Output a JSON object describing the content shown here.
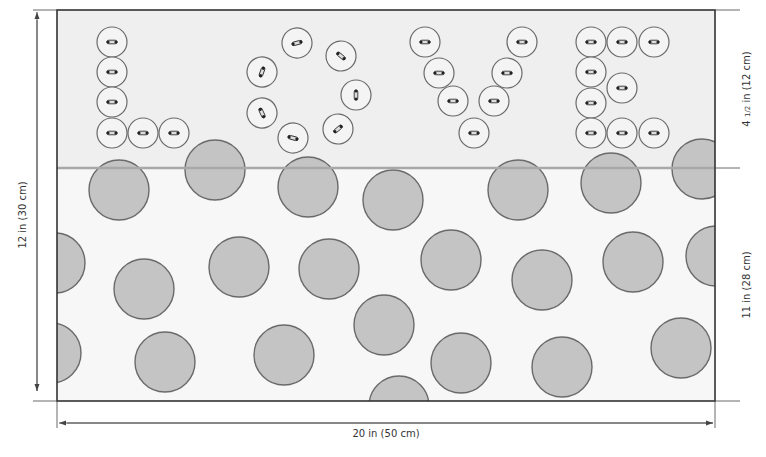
{
  "diagram": {
    "panel": {
      "x": 57,
      "y": 10,
      "width": 658,
      "height": 391
    },
    "divider_y": 168,
    "colors": {
      "top_fill": "#efefef",
      "bottom_fill": "#f7f7f7",
      "outline": "#333333",
      "divider": "#a8a8a8",
      "dot_fill": "#c4c4c4",
      "dot_stroke": "#6a6a6a",
      "button_fill": "#f4f4f4",
      "button_stroke": "#6a6a6a",
      "dimension_line": "#444444"
    },
    "letters": [
      "L",
      "O",
      "V",
      "E"
    ],
    "buttons": [
      {
        "letter": "L",
        "cx": 112,
        "cy": 42,
        "angle": 0
      },
      {
        "letter": "L",
        "cx": 112,
        "cy": 72,
        "angle": 0
      },
      {
        "letter": "L",
        "cx": 112,
        "cy": 102,
        "angle": 0
      },
      {
        "letter": "L",
        "cx": 112,
        "cy": 133,
        "angle": 0
      },
      {
        "letter": "L",
        "cx": 143,
        "cy": 133,
        "angle": 0
      },
      {
        "letter": "L",
        "cx": 174,
        "cy": 133,
        "angle": 0
      },
      {
        "letter": "O",
        "cx": 297,
        "cy": 43,
        "angle": -15
      },
      {
        "letter": "O",
        "cx": 341,
        "cy": 56,
        "angle": 40
      },
      {
        "letter": "O",
        "cx": 262,
        "cy": 72,
        "angle": -70
      },
      {
        "letter": "O",
        "cx": 356,
        "cy": 95,
        "angle": 90
      },
      {
        "letter": "O",
        "cx": 262,
        "cy": 113,
        "angle": 65
      },
      {
        "letter": "O",
        "cx": 338,
        "cy": 129,
        "angle": -40
      },
      {
        "letter": "O",
        "cx": 293,
        "cy": 138,
        "angle": 15
      },
      {
        "letter": "V",
        "cx": 425,
        "cy": 42,
        "angle": 0
      },
      {
        "letter": "V",
        "cx": 522,
        "cy": 42,
        "angle": 0
      },
      {
        "letter": "V",
        "cx": 439,
        "cy": 73,
        "angle": 0
      },
      {
        "letter": "V",
        "cx": 507,
        "cy": 73,
        "angle": 0
      },
      {
        "letter": "V",
        "cx": 453,
        "cy": 101,
        "angle": 0
      },
      {
        "letter": "V",
        "cx": 494,
        "cy": 101,
        "angle": 0
      },
      {
        "letter": "V",
        "cx": 474,
        "cy": 133,
        "angle": 0
      },
      {
        "letter": "E",
        "cx": 591,
        "cy": 42,
        "angle": 0
      },
      {
        "letter": "E",
        "cx": 622,
        "cy": 42,
        "angle": 0
      },
      {
        "letter": "E",
        "cx": 654,
        "cy": 42,
        "angle": 0
      },
      {
        "letter": "E",
        "cx": 591,
        "cy": 72,
        "angle": 0
      },
      {
        "letter": "E",
        "cx": 622,
        "cy": 88,
        "angle": 0
      },
      {
        "letter": "E",
        "cx": 591,
        "cy": 103,
        "angle": 0
      },
      {
        "letter": "E",
        "cx": 591,
        "cy": 133,
        "angle": 0
      },
      {
        "letter": "E",
        "cx": 622,
        "cy": 133,
        "angle": 0
      },
      {
        "letter": "E",
        "cx": 654,
        "cy": 133,
        "angle": 0
      }
    ],
    "button_radius": 15,
    "dots": [
      {
        "cx": 119,
        "cy": 190,
        "r": 30
      },
      {
        "cx": 215,
        "cy": 170,
        "r": 30
      },
      {
        "cx": 308,
        "cy": 187,
        "r": 30
      },
      {
        "cx": 393,
        "cy": 200,
        "r": 30
      },
      {
        "cx": 518,
        "cy": 190,
        "r": 30
      },
      {
        "cx": 611,
        "cy": 183,
        "r": 30
      },
      {
        "cx": 702,
        "cy": 169,
        "r": 30
      },
      {
        "cx": 55,
        "cy": 263,
        "r": 30
      },
      {
        "cx": 144,
        "cy": 289,
        "r": 30
      },
      {
        "cx": 239,
        "cy": 267,
        "r": 30
      },
      {
        "cx": 329,
        "cy": 269,
        "r": 30
      },
      {
        "cx": 451,
        "cy": 260,
        "r": 30
      },
      {
        "cx": 542,
        "cy": 280,
        "r": 30
      },
      {
        "cx": 633,
        "cy": 262,
        "r": 30
      },
      {
        "cx": 716,
        "cy": 256,
        "r": 30
      },
      {
        "cx": 51,
        "cy": 353,
        "r": 30
      },
      {
        "cx": 165,
        "cy": 362,
        "r": 30
      },
      {
        "cx": 284,
        "cy": 355,
        "r": 30
      },
      {
        "cx": 384,
        "cy": 325,
        "r": 30
      },
      {
        "cx": 461,
        "cy": 363,
        "r": 30
      },
      {
        "cx": 562,
        "cy": 367,
        "r": 30
      },
      {
        "cx": 681,
        "cy": 348,
        "r": 30
      },
      {
        "cx": 399,
        "cy": 406,
        "r": 30
      }
    ]
  },
  "dimensions": {
    "total_height": "12 in (30 cm)",
    "top_band_height": "4 ½ in (12 cm)",
    "top_band_height_whole": "4",
    "top_band_height_frac": "1/2",
    "top_band_height_rest": "in (12 cm)",
    "bottom_band_height": "11 in (28 cm)",
    "total_width": "20 in (50 cm)"
  }
}
